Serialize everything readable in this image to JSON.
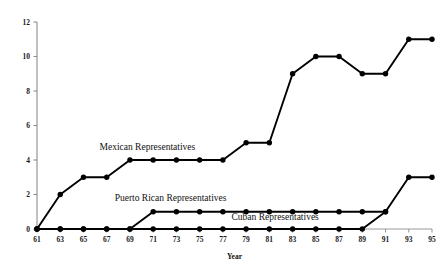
{
  "chart_data": {
    "type": "line",
    "title": "",
    "xlabel": "Year",
    "ylabel": "",
    "xlim": [
      61,
      95
    ],
    "ylim": [
      0,
      12
    ],
    "grid": false,
    "legend_position": "inline-annotations",
    "x": [
      61,
      63,
      65,
      67,
      69,
      71,
      73,
      75,
      77,
      79,
      81,
      83,
      85,
      87,
      89,
      91,
      93,
      95
    ],
    "xticklabels": [
      "61",
      "63",
      "65",
      "67",
      "69",
      "71",
      "73",
      "75",
      "77",
      "79",
      "81",
      "83",
      "85",
      "87",
      "89",
      "91",
      "93",
      "95"
    ],
    "yticks": [
      0,
      2,
      4,
      6,
      8,
      10,
      12
    ],
    "yticklabels": [
      "0",
      "2",
      "4",
      "6",
      "8",
      "10",
      "12"
    ],
    "series": [
      {
        "name": "Mexican Representatives",
        "x": [
          61,
          63,
          65,
          67,
          69,
          71,
          73,
          75,
          77,
          79,
          81,
          83,
          85,
          87,
          89,
          91,
          93,
          95
        ],
        "values": [
          0,
          2,
          3,
          3,
          4,
          4,
          4,
          4,
          4,
          5,
          5,
          9,
          10,
          10,
          9,
          9,
          11,
          11
        ],
        "color": "#000000",
        "marker": "filled-circle"
      },
      {
        "name": "Puerto Rican Representatives",
        "x": [
          61,
          63,
          65,
          67,
          69,
          71,
          73,
          75,
          77,
          79,
          81,
          83,
          85,
          87,
          89,
          91
        ],
        "values": [
          0,
          0,
          0,
          0,
          0,
          1,
          1,
          1,
          1,
          1,
          1,
          1,
          1,
          1,
          1,
          1
        ],
        "color": "#000000",
        "marker": "filled-circle"
      },
      {
        "name": "Cuban Representatives",
        "x": [
          61,
          63,
          65,
          67,
          69,
          71,
          73,
          75,
          77,
          79,
          81,
          83,
          85,
          87,
          89,
          91,
          93,
          95
        ],
        "values": [
          0,
          0,
          0,
          0,
          0,
          0,
          0,
          0,
          0,
          0,
          0,
          0,
          0,
          0,
          0,
          1,
          3,
          3
        ],
        "color": "#000000",
        "marker": "filled-circle"
      }
    ],
    "annotations": [
      {
        "text": "Mexican Representatives",
        "x": 70.5,
        "y": 4.6
      },
      {
        "text": "Puerto Rican Representatives",
        "x": 72.5,
        "y": 1.65
      },
      {
        "text": "Cuban Representatives",
        "x": 81.5,
        "y": 0.52
      }
    ]
  }
}
